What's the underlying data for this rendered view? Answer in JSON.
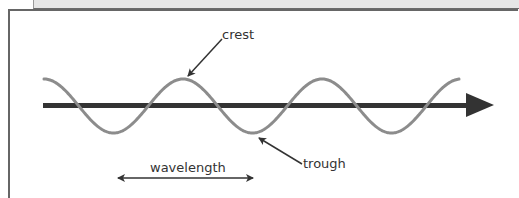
{
  "diagram": {
    "labels": {
      "crest": "crest",
      "trough": "trough",
      "wavelength": "wavelength"
    },
    "colors": {
      "wave": "#8c8c8c",
      "axis": "#333333",
      "annotation": "#333333",
      "frame": "#666666",
      "top_bar": "#e6e6e6"
    },
    "wave": {
      "start_x": 44,
      "end_x": 459,
      "baseline_y": 106,
      "amplitude": 27,
      "wavelength_px": 139,
      "crests_x": [
        186,
        325
      ],
      "troughs_x": [
        116,
        255,
        393
      ]
    },
    "axis": {
      "x1": 43,
      "x2": 493,
      "y": 106,
      "direction": "right"
    }
  }
}
